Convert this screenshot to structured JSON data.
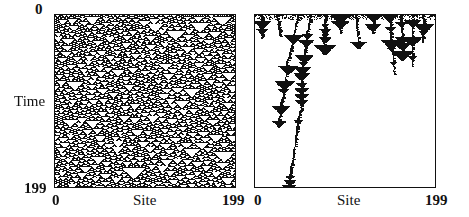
{
  "figure": {
    "panels": [
      {
        "id": "left",
        "description": "Space-time diagram of a cellular automaton showing a disordered pattern of nested triangles",
        "y_axis": {
          "label": "Time",
          "top_tick": "0",
          "bottom_tick": "199"
        },
        "x_axis": {
          "label": "Site",
          "left_tick": "0",
          "right_tick": "199"
        },
        "fill_density": "dense"
      },
      {
        "id": "right",
        "description": "Space-time diagram where activity dies out, leaving a few wandering triangle trails",
        "x_axis": {
          "label": "Site",
          "left_tick": "0",
          "right_tick": "199"
        },
        "fill_density": "sparse"
      }
    ],
    "colors": {
      "ink": "#111111",
      "paper": "#ffffff"
    }
  }
}
